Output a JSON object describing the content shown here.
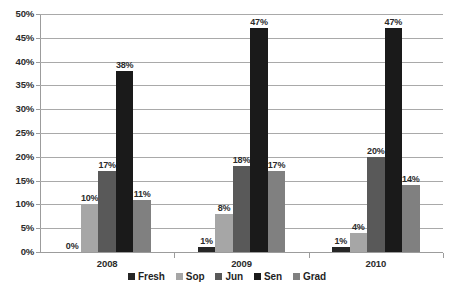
{
  "chart_data": {
    "type": "bar",
    "title": "",
    "subtitle": "",
    "xlabel": "",
    "ylabel": "",
    "categories": [
      "2008",
      "2009",
      "2010"
    ],
    "series": [
      {
        "name": "Fresh",
        "color": "#262626",
        "values": [
          0,
          1,
          1
        ],
        "labels": [
          "0%",
          "1%",
          "1%"
        ]
      },
      {
        "name": "Sop",
        "color": "#a6a6a6",
        "values": [
          10,
          8,
          4
        ],
        "labels": [
          "10%",
          "8%",
          "4%"
        ]
      },
      {
        "name": "Jun",
        "color": "#595959",
        "values": [
          17,
          18,
          20
        ],
        "labels": [
          "17%",
          "18%",
          "20%"
        ]
      },
      {
        "name": "Sen",
        "color": "#1a1a1a",
        "values": [
          38,
          47,
          47
        ],
        "labels": [
          "38%",
          "47%",
          "47%"
        ]
      },
      {
        "name": "Grad",
        "color": "#808080",
        "values": [
          11,
          17,
          14
        ],
        "labels": [
          "11%",
          "17%",
          "14%"
        ]
      }
    ],
    "ylim": [
      0,
      50
    ],
    "ytick_values": [
      50,
      45,
      40,
      35,
      30,
      25,
      20,
      15,
      10,
      5,
      0
    ],
    "ytick_labels": [
      "50%",
      "45%",
      "40%",
      "35%",
      "30%",
      "25%",
      "20%",
      "15%",
      "10%",
      "5%",
      "0%"
    ],
    "grid": true,
    "grid_axis": "y",
    "legend_position": "bottom",
    "data_labels": true,
    "background_color": "#ffffff",
    "gridline_color": "#a9a9a9",
    "axis_color": "#9c9c9c",
    "text_color": "#2b2b2b"
  },
  "legend": {
    "items": [
      {
        "label": "Fresh"
      },
      {
        "label": "Sop"
      },
      {
        "label": "Jun"
      },
      {
        "label": "Sen"
      },
      {
        "label": "Grad"
      }
    ]
  }
}
